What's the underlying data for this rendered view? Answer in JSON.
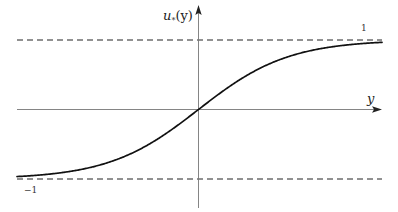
{
  "figure": {
    "axes": {
      "x_label": "y",
      "y_label_base": "u",
      "y_label_sub": "*",
      "y_label_arg": "(y)"
    },
    "asymptotes": {
      "upper_label": "1",
      "lower_label": "−1",
      "upper_value": 1,
      "lower_value": -1
    },
    "curve": {
      "type": "tanh",
      "passes_through_origin": true,
      "limit_right": 1,
      "limit_left": -1
    },
    "colors": {
      "curve": "#111111",
      "axis": "#555555",
      "dashed": "#222222",
      "background": "#ffffff"
    }
  }
}
